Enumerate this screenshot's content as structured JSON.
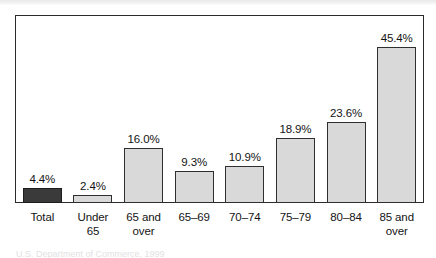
{
  "figure": {
    "source_note": "U.S. Department of Commerce, 1999"
  },
  "chart_data": {
    "type": "bar",
    "title": "",
    "subtitle": "",
    "xlabel": "",
    "ylabel": "",
    "ylim": [
      0,
      50
    ],
    "grid": false,
    "legend": "none",
    "value_label_format": "percent_one_decimal",
    "categories": [
      "Total",
      "Under\n65",
      "65 and\nover",
      "65–69",
      "70–74",
      "75–79",
      "80–84",
      "85 and\nover"
    ],
    "values": [
      4.4,
      2.4,
      16.0,
      9.3,
      10.9,
      18.9,
      23.6,
      45.4
    ],
    "value_labels": [
      "4.4%",
      "2.4%",
      "16.0%",
      "9.3%",
      "10.9%",
      "18.9%",
      "23.6%",
      "45.4%"
    ],
    "bar_colors": [
      "#3a3a3a",
      "#d9d9d9",
      "#d9d9d9",
      "#d9d9d9",
      "#d9d9d9",
      "#d9d9d9",
      "#d9d9d9",
      "#d9d9d9"
    ],
    "bar_border_color": "#2f2f2f",
    "frame_color": "#2b2b2b",
    "background_color": "#ffffff"
  }
}
